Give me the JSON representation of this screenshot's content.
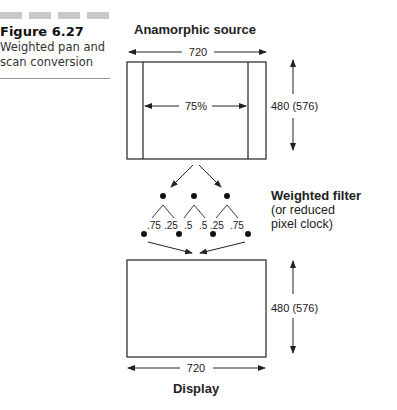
{
  "caption": {
    "figure_number": "Figure 6.27",
    "title_line1": "Weighted pan and",
    "title_line2": "scan conversion",
    "bar_color": "#c8c8c8"
  },
  "diagram": {
    "source_title": "Anamorphic source",
    "source_width_label": "720",
    "source_height_label": "480 (576)",
    "pan_scan_label": "75%",
    "filter_title": "Weighted filter",
    "filter_note_line1": "(or reduced",
    "filter_note_line2": "pixel clock)",
    "weights": [
      ".75",
      ".25",
      ".5",
      ".5",
      ".25",
      ".75"
    ],
    "display_width_label": "720",
    "display_height_label": "480 (576)",
    "display_title": "Display",
    "line_color": "#222222"
  }
}
